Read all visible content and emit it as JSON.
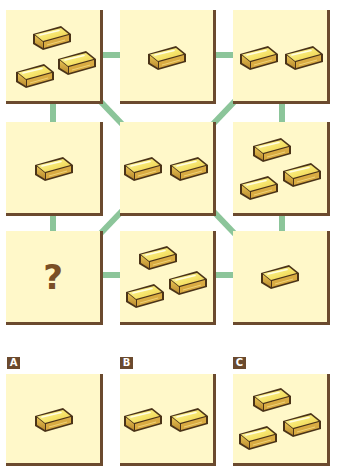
{
  "puzzle": {
    "grid": [
      {
        "id": "r1c1",
        "bars": 3
      },
      {
        "id": "r1c2",
        "bars": 1
      },
      {
        "id": "r1c3",
        "bars": 2
      },
      {
        "id": "r2c1",
        "bars": 1
      },
      {
        "id": "r2c2",
        "bars": 2
      },
      {
        "id": "r2c3",
        "bars": 3
      },
      {
        "id": "r3c1",
        "bars": null,
        "placeholder": "?"
      },
      {
        "id": "r3c2",
        "bars": 3
      },
      {
        "id": "r3c3",
        "bars": 1
      }
    ],
    "missing_symbol": "?"
  },
  "options": [
    {
      "label": "A",
      "bars": 1
    },
    {
      "label": "B",
      "bars": 2
    },
    {
      "label": "C",
      "bars": 3
    }
  ],
  "icons": {
    "item": "gold-bar-icon"
  },
  "colors": {
    "panel_bg": "#fff8c9",
    "panel_shadow": "#6b4a2e",
    "connector": "#8cc59a",
    "gold_light": "#fbf38a",
    "gold_mid": "#f2d35a",
    "gold_dark": "#c99a35",
    "outline": "#4a3318",
    "question_mark": "#7a4f26",
    "label_bg": "#6b4a2e"
  }
}
